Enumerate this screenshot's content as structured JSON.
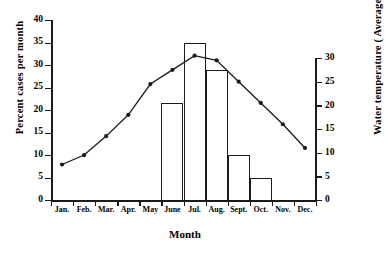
{
  "chart_data": {
    "type": "bar",
    "title": "",
    "xlabel": "Month",
    "ylabel": "Percent cases per month",
    "y2label": "Water temperature ( Average )",
    "categories": [
      "Jan.",
      "Feb.",
      "Mar.",
      "Apr.",
      "May",
      "June",
      "Jul.",
      "Aug.",
      "Sept.",
      "Oct.",
      "Nov.",
      "Dec."
    ],
    "ylim": [
      0,
      40
    ],
    "yticks": [
      0,
      5,
      10,
      15,
      20,
      25,
      30,
      35,
      40
    ],
    "y2lim": [
      0,
      30
    ],
    "y2ticks": [
      0,
      5,
      10,
      15,
      20,
      25,
      30
    ],
    "grid": false,
    "legend": "none",
    "series": [
      {
        "name": "Percent cases per month",
        "type": "bar",
        "axis": "left",
        "values": [
          0,
          0,
          0,
          0,
          0,
          21.5,
          35,
          29,
          10,
          5,
          0,
          0
        ]
      },
      {
        "name": "Water temperature ( Average )",
        "type": "line",
        "axis": "right",
        "marker": "filled-circle",
        "values": [
          7.5,
          9.5,
          13.5,
          18,
          24.5,
          27.5,
          30.5,
          29.5,
          25,
          20.5,
          16,
          11
        ]
      }
    ]
  },
  "axes": {
    "left_title": "Percent cases per month",
    "right_title": "Water temperature ( Average )",
    "x_title": "Month"
  },
  "left_ticks": [
    "40",
    "35",
    "30",
    "25",
    "20",
    "15",
    "10",
    "5",
    "0"
  ],
  "right_ticks": [
    "30",
    "25",
    "20",
    "15",
    "10",
    "5",
    "0"
  ],
  "month_labels": [
    "Jan.",
    "Feb.",
    "Mar.",
    "Apr.",
    "May",
    "June",
    "Jul.",
    "Aug.",
    "Sept.",
    "Oct.",
    "Nov.",
    "Dec."
  ],
  "colors": {
    "ink": "#1a1a1a",
    "background": "#ffffff"
  }
}
